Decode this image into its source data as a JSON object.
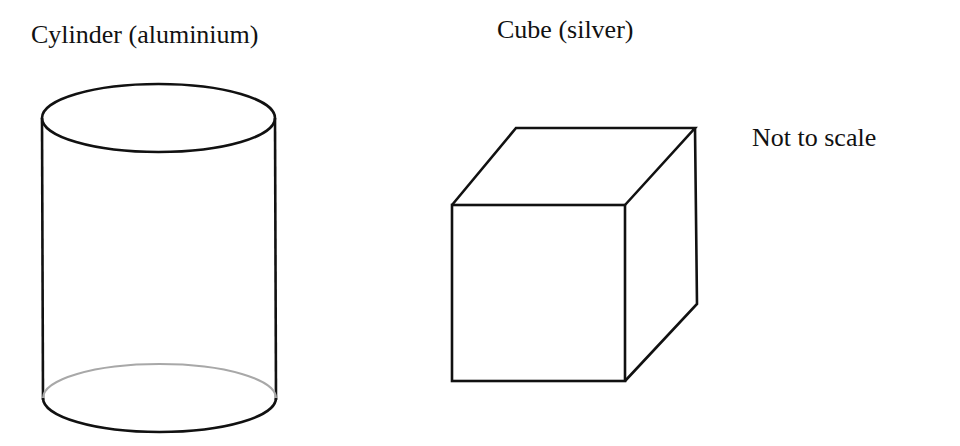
{
  "labels": {
    "cylinder": "Cylinder (aluminium)",
    "cube": "Cube (silver)",
    "scale_note": "Not to scale"
  },
  "shapes": {
    "cylinder": {
      "material": "aluminium",
      "stroke": "#111111",
      "hidden_edge_color": "#a8a8a8"
    },
    "cube": {
      "material": "silver",
      "stroke": "#111111"
    }
  }
}
